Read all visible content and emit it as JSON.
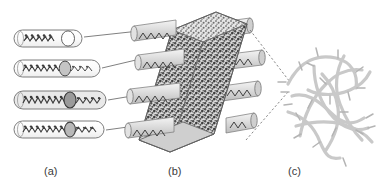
{
  "figure": {
    "type": "scientific-schematic",
    "background_color": "#ffffff",
    "width": 382,
    "height": 193,
    "panels": [
      {
        "id": "a",
        "label": "(a)",
        "label_x": 44,
        "label_y": 165,
        "description": "Four elongated capsules, each enclosing a dark zig-zag polymer chain; the chains increase in length from top to bottom and an additional segment is appended at a circular junction.",
        "items": [
          {
            "name": "capsule-1",
            "x": 14,
            "y": 30,
            "width": 68,
            "height": 17,
            "chain_segments": 5,
            "junction": "empty-circle",
            "tail_segments": 0
          },
          {
            "name": "capsule-2",
            "x": 14,
            "y": 60,
            "width": 86,
            "height": 17,
            "chain_segments": 6,
            "junction": "shaded-circle",
            "tail_segments": 4
          },
          {
            "name": "capsule-3",
            "x": 14,
            "y": 91,
            "width": 92,
            "height": 18,
            "chain_segments": 7,
            "junction": "dark-circle",
            "tail_segments": 4
          },
          {
            "name": "capsule-4",
            "x": 14,
            "y": 121,
            "width": 90,
            "height": 17,
            "chain_segments": 7,
            "junction": "shaded-circle",
            "tail_segments": 4
          }
        ]
      },
      {
        "id": "b",
        "label": "(b)",
        "label_x": 168,
        "label_y": 165,
        "description": "Three-dimensional parallelepiped slab with dense dark speckled interior, penetrated by cylindrical channels protruding from the left and right faces; each cylinder contains a polymer chain.",
        "cylinders_left": 4,
        "cylinders_right": 4,
        "slab_fill": "#6b6b6b",
        "cylinder_fill": "#d8d8d8"
      },
      {
        "id": "c",
        "label": "(c)",
        "label_x": 288,
        "label_y": 165,
        "description": "Entangled network of light-grey fibres bearing short perpendicular side branches.",
        "fiber_color": "#c9c9c9",
        "branch_color": "#b4b4b4",
        "fiber_count": 9
      }
    ],
    "connectors": [
      {
        "name": "leader-a1-to-b",
        "style": "solid-arrow",
        "from_panel": "a",
        "to_panel": "b"
      },
      {
        "name": "leader-a2-to-b",
        "style": "solid-arrow",
        "from_panel": "a",
        "to_panel": "b"
      },
      {
        "name": "leader-a3-to-b",
        "style": "solid-arrow",
        "from_panel": "a",
        "to_panel": "b"
      },
      {
        "name": "leader-a4-to-b",
        "style": "solid-arrow",
        "from_panel": "a",
        "to_panel": "b"
      },
      {
        "name": "leader-b-to-c-upper",
        "style": "dashed",
        "from_panel": "b",
        "to_panel": "c"
      },
      {
        "name": "leader-b-to-c-lower",
        "style": "dashed",
        "from_panel": "b",
        "to_panel": "c"
      }
    ],
    "colors": {
      "line": "#4a4a4a",
      "chain": "#3c3c3c",
      "capsule_stroke": "#6e6e6e",
      "capsule_fill": "#fbfbfb",
      "slab_dark": "#5e5e5e",
      "slab_edge": "#8a8a8a",
      "fiber": "#c9c9c9",
      "label": "#3a3a3a"
    }
  }
}
